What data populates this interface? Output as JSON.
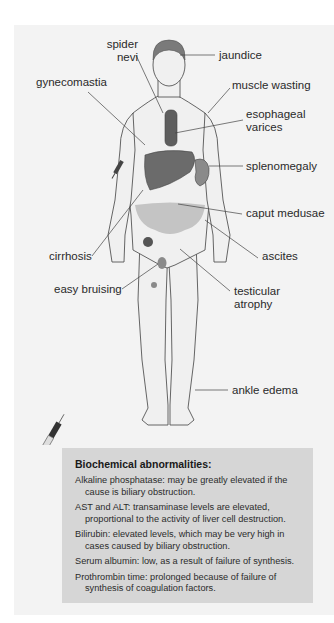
{
  "figure": {
    "labels": {
      "spider_nevi": [
        "spider",
        "nevi"
      ],
      "jaundice": "jaundice",
      "gynecomastia": "gynecomastia",
      "muscle_wasting": "muscle wasting",
      "esophageal_varices": [
        "esophageal",
        "varices"
      ],
      "splenomegaly": "splenomegaly",
      "caput_medusae": "caput medusae",
      "cirrhosis": "cirrhosis",
      "ascites": "ascites",
      "easy_bruising": "easy bruising",
      "testicular_atrophy": [
        "testicular",
        "atrophy"
      ],
      "ankle_edema": "ankle edema"
    },
    "colors": {
      "panel_bg": "#f3f3f3",
      "body_fill": "#f0f0f0",
      "outline": "#555555",
      "liver": "#6b6b6b",
      "spleen": "#8a8a8a",
      "ascites": "#c4c4c4",
      "info_bg": "#d6d6d6"
    }
  },
  "info_box": {
    "title": "Biochemical abnormalities:",
    "items": [
      "Alkaline phosphatase: may be greatly elevated if the cause is biliary obstruction.",
      "AST and ALT: transaminase levels are elevated, proportional to the activity of liver cell destruction.",
      "Bilirubin: elevated levels, which may be very high in cases caused by biliary obstruction.",
      "Serum albumin: low, as a result of failure of synthesis.",
      "Prothrombin time: prolonged because of failure of synthesis of coagulation factors."
    ]
  }
}
